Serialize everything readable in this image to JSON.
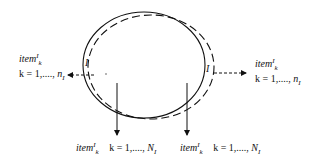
{
  "diagram": {
    "type": "set-flow-diagram",
    "shapes": {
      "solid_ellipse": {
        "cx": 144,
        "cy": 65,
        "rx": 61,
        "ry": 53,
        "stroke": "#111111",
        "style": "solid"
      },
      "dashed_ellipse": {
        "cx": 151,
        "cy": 67,
        "rx": 63,
        "ry": 52,
        "stroke": "#111111",
        "style": "dashed"
      }
    },
    "inner_labels": [
      {
        "id": "left-I",
        "text": "I"
      },
      {
        "id": "right-I",
        "text": "I"
      }
    ],
    "arrows": [
      {
        "id": "left-out",
        "style": "dashed",
        "direction": "left"
      },
      {
        "id": "right-out",
        "style": "dashed",
        "direction": "right"
      },
      {
        "id": "down-left",
        "style": "solid",
        "direction": "down"
      },
      {
        "id": "down-right",
        "style": "solid",
        "direction": "down"
      }
    ],
    "labels": {
      "left": {
        "item_base": "item",
        "item_sup": "I",
        "item_sub": "k",
        "range_prefix": "k = 1,...., ",
        "range_var": "n",
        "range_sub": "I"
      },
      "right": {
        "item_base": "item",
        "item_sup": "I",
        "item_sub": "k",
        "range_prefix": "k = 1,...., ",
        "range_var": "n",
        "range_sub": "I"
      },
      "bottom_left": {
        "item_base": "item",
        "item_sup": "I",
        "item_sub": "k",
        "range_prefix": "k = 1,...., ",
        "range_var": "N",
        "range_sub": "I"
      },
      "bottom_right": {
        "item_base": "item",
        "item_sup": "I",
        "item_sub": "k",
        "range_prefix": "k = 1,...., ",
        "range_var": "N",
        "range_sub": "I"
      }
    }
  }
}
